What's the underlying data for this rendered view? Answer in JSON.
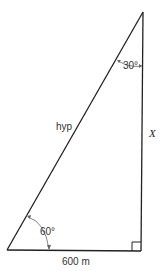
{
  "diagram": {
    "type": "right-triangle",
    "labels": {
      "top_angle": "30°",
      "bottom_angle": "60°",
      "hypotenuse": "hyp",
      "vertical_side": "X",
      "base": "600 m"
    },
    "colors": {
      "line": "#222222",
      "text": "#333333",
      "background": "#ffffff"
    }
  }
}
